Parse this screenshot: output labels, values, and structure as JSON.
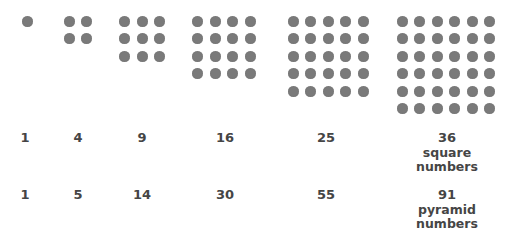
{
  "diagram": {
    "dot_color": "#7a7a7a",
    "text_color": "#454545",
    "groups": [
      {
        "size": 1,
        "center_x": 27
      },
      {
        "size": 2,
        "center_x": 78
      },
      {
        "size": 3,
        "center_x": 142
      },
      {
        "size": 4,
        "center_x": 224
      },
      {
        "size": 5,
        "center_x": 328
      },
      {
        "size": 6,
        "center_x": 446
      }
    ],
    "square_numbers": [
      "1",
      "4",
      "9",
      "16",
      "25",
      "36"
    ],
    "square_caption": [
      "square",
      "numbers"
    ],
    "pyramid_numbers": [
      "1",
      "5",
      "14",
      "30",
      "55",
      "91"
    ],
    "pyramid_caption": [
      "pyramid",
      "numbers"
    ]
  }
}
